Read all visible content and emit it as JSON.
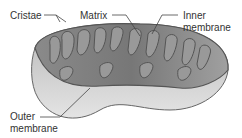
{
  "diagram": {
    "labels": {
      "cristae": "Cristae",
      "matrix": "Matrix",
      "inner_line1": "Inner",
      "inner_line2": "membrane",
      "outer_line1": "Outer",
      "outer_line2": "membrane"
    }
  }
}
